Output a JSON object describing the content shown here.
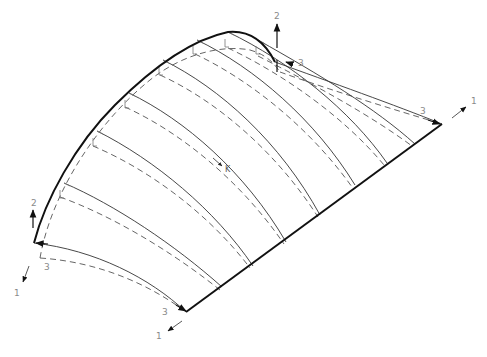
{
  "figure": {
    "colors": {
      "background": "#ffffff",
      "edge": "#111111",
      "rib": "#333333",
      "dashed": "#555555",
      "label": "#8a8a8a"
    }
  },
  "axes": {
    "top": {
      "axis2": "2",
      "axis3": "3"
    },
    "right": {
      "axis1": "1",
      "axis3": "3"
    },
    "left": {
      "axis2": "2",
      "axis1": "1",
      "axis3": "3"
    },
    "bottom": {
      "axis1": "1",
      "axis3": "3"
    }
  },
  "center_marker": {
    "label": "K"
  }
}
